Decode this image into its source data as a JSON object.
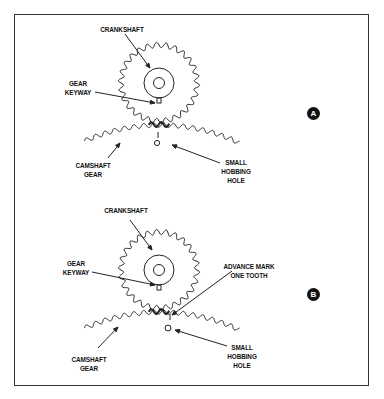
{
  "figure": {
    "panels": [
      {
        "id": "A",
        "badge": "A",
        "labels": {
          "crankshaft": "CRANKSHAFT",
          "gear_keyway": [
            "GEAR",
            "KEYWAY"
          ],
          "camshaft_gear": [
            "CAMSHAFT",
            "GEAR"
          ],
          "small_hobbing_hole": [
            "SMALL",
            "HOBBING",
            "HOLE"
          ]
        }
      },
      {
        "id": "B",
        "badge": "B",
        "labels": {
          "crankshaft": "CRANKSHAFT",
          "gear_keyway": [
            "GEAR",
            "KEYWAY"
          ],
          "advance_mark": [
            "ADVANCE MARK",
            "ONE TOOTH"
          ],
          "camshaft_gear": [
            "CAMSHAFT",
            "GEAR"
          ],
          "small_hobbing_hole": [
            "SMALL",
            "HOBBING",
            "HOLE"
          ]
        }
      }
    ],
    "colors": {
      "line": "#222222",
      "frame": "#333333",
      "background": "#ffffff"
    }
  }
}
